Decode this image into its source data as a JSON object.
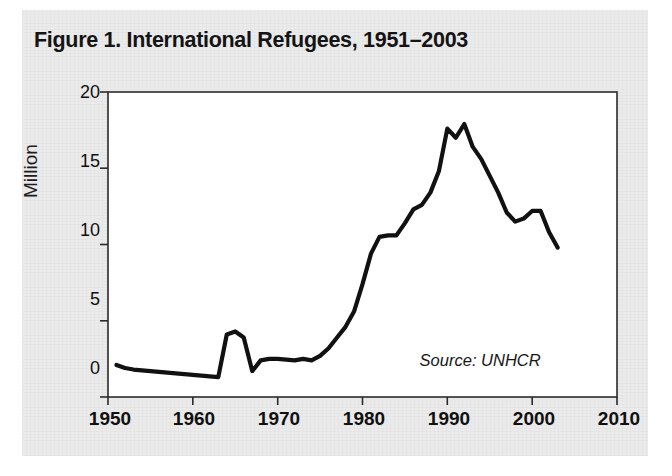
{
  "figure": {
    "title": "Figure 1. International Refugees, 1951–2003",
    "source_note": "Source: UNHCR",
    "panel_background": "#ebebeb",
    "plot_background": "#ffffff",
    "line_color": "#111111",
    "axis_color": "#2b2b2b"
  },
  "chart_data": {
    "type": "line",
    "title": "Figure 1. International Refugees, 1951–2003",
    "subtitle": "",
    "xlabel": "",
    "ylabel": "Million",
    "xlim": [
      1950,
      2010
    ],
    "ylim": [
      0,
      20
    ],
    "xticks": [
      1950,
      1960,
      1970,
      1980,
      1990,
      2000,
      2010
    ],
    "xtick_labels": [
      "1950",
      "1960",
      "1970",
      "1980",
      "1990",
      "2000",
      "2010"
    ],
    "yticks": [
      0,
      5,
      10,
      15,
      20
    ],
    "ytick_labels": [
      "0",
      "5",
      "10",
      "15",
      "20"
    ],
    "grid": false,
    "legend": false,
    "annotations": [
      {
        "text": "Source: UNHCR",
        "x": 2001,
        "y": 2.2,
        "style": "italic",
        "align": "right"
      }
    ],
    "series": [
      {
        "name": "International refugees",
        "units": "million",
        "x": [
          1951,
          1952,
          1953,
          1954,
          1955,
          1956,
          1957,
          1958,
          1959,
          1960,
          1961,
          1962,
          1963,
          1964,
          1965,
          1966,
          1967,
          1968,
          1969,
          1970,
          1971,
          1972,
          1973,
          1974,
          1975,
          1976,
          1977,
          1978,
          1979,
          1980,
          1981,
          1982,
          1983,
          1984,
          1985,
          1986,
          1987,
          1988,
          1989,
          1990,
          1991,
          1992,
          1993,
          1994,
          1995,
          1996,
          1997,
          1998,
          1999,
          2000,
          2001,
          2002,
          2003
        ],
        "values": [
          2.1,
          1.9,
          1.8,
          1.75,
          1.7,
          1.65,
          1.6,
          1.55,
          1.5,
          1.45,
          1.4,
          1.35,
          1.3,
          4.1,
          4.3,
          3.9,
          1.7,
          2.4,
          2.5,
          2.5,
          2.45,
          2.4,
          2.5,
          2.4,
          2.7,
          3.2,
          3.9,
          4.6,
          5.6,
          7.4,
          9.4,
          10.5,
          10.6,
          10.6,
          11.4,
          12.3,
          12.6,
          13.4,
          14.8,
          17.6,
          17.0,
          17.9,
          16.4,
          15.6,
          14.5,
          13.4,
          12.1,
          11.5,
          11.7,
          12.2,
          12.2,
          10.8,
          9.8
        ]
      }
    ]
  },
  "axes": {
    "y_axis_title": "Million",
    "y_tick_values": [
      "20",
      "15",
      "10",
      "5",
      "0"
    ],
    "x_tick_values": [
      "1950",
      "1960",
      "1970",
      "1980",
      "1990",
      "2000",
      "2010"
    ]
  }
}
